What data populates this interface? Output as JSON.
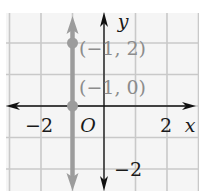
{
  "chart_data": {
    "type": "line",
    "title": "",
    "xlabel": "x",
    "ylabel": "y",
    "origin_label": "O",
    "xlim": [
      -3,
      3
    ],
    "ylim": [
      -2.5,
      3
    ],
    "grid": true,
    "x_tick_labels": [
      {
        "value": -2,
        "label": "−2"
      },
      {
        "value": 2,
        "label": "2"
      }
    ],
    "y_tick_labels": [
      {
        "value": -2,
        "label": "−2"
      }
    ],
    "series": [
      {
        "name": "x = -1",
        "kind": "vertical-line",
        "x": -1,
        "arrows": "both",
        "color": "#9c9c9c"
      }
    ],
    "points": [
      {
        "x": -1,
        "y": 2,
        "label": "(−1, 2)",
        "color": "#9c9c9c"
      },
      {
        "x": -1,
        "y": 0,
        "label": "(−1, 0)",
        "color": "#9c9c9c"
      }
    ],
    "colors": {
      "grid": "#c9c9c9",
      "axes": "#111111",
      "line": "#9c9c9c",
      "point_label": "#8c8c8c",
      "background": "#f5f5f5"
    }
  }
}
